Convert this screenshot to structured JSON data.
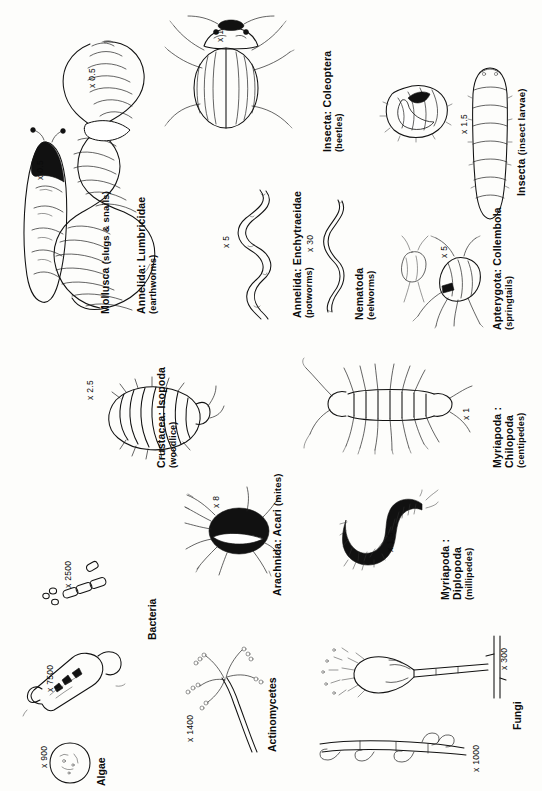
{
  "figure": {
    "orientation": "labels rotated 90 degrees counter-clockwise",
    "background_color": "#fdfdfb",
    "ink_color": "#111111"
  },
  "organisms": [
    {
      "id": "algae",
      "taxon": "Algae",
      "common": "",
      "magnification": "x 900",
      "icon": "algae-cell-icon"
    },
    {
      "id": "bacteria",
      "taxon": "Bacteria",
      "common": "",
      "magnification": "x 2500",
      "magnification_secondary": "x 7500",
      "icon": "bacteria-rods-icon"
    },
    {
      "id": "actinomycetes",
      "taxon": "Actinomycetes",
      "common": "",
      "magnification": "x 1400",
      "icon": "actinomycete-filament-icon"
    },
    {
      "id": "fungi",
      "taxon": "Fungi",
      "common": "",
      "magnification": "x 300",
      "magnification_secondary": "x 1000",
      "icon": "fungus-hypha-icon"
    },
    {
      "id": "acari",
      "taxon": "Arachnida: Acari",
      "common": "(mites)",
      "magnification": "x 8",
      "icon": "mite-icon"
    },
    {
      "id": "diplopoda",
      "taxon": "Myriapoda :",
      "taxon_line2": "Diplopoda",
      "common": "(millipedes)",
      "magnification": "x 1.5",
      "icon": "millipede-icon"
    },
    {
      "id": "isopoda",
      "taxon": "Crustacea: Isopoda",
      "common": "(woodlice)",
      "magnification": "x 2.5",
      "icon": "woodlouse-icon"
    },
    {
      "id": "chilopoda",
      "taxon": "Myriapoda :",
      "taxon_line2": "Chilopoda",
      "common": "(centipedes)",
      "magnification": "x 1",
      "icon": "centipede-icon"
    },
    {
      "id": "enchytraeidae",
      "taxon": "Annelida: Enchytraeidae",
      "common": "(potworms)",
      "magnification": "x 5",
      "icon": "potworm-icon"
    },
    {
      "id": "nematoda",
      "taxon": "Nematoda",
      "common": "(eelworms)",
      "magnification": "x 30",
      "icon": "eelworm-icon"
    },
    {
      "id": "collembola",
      "taxon": "Apterygota: Collembola",
      "common": "(springtails)",
      "magnification": "x 5",
      "icon": "springtail-icon"
    },
    {
      "id": "mollusca",
      "taxon": "Mollusca",
      "common": "(slugs & snails)",
      "magnification": "x 0.5",
      "icon": "slug-icon"
    },
    {
      "id": "lumbricidae",
      "taxon": "Annelida: Lumbricidae",
      "common": "(earthworms)",
      "magnification": "x 0.5",
      "icon": "earthworm-icon"
    },
    {
      "id": "coleoptera",
      "taxon": "Insecta: Coleoptera",
      "common": "(beetles)",
      "magnification": "x 1",
      "icon": "beetle-icon"
    },
    {
      "id": "insect_larvae",
      "taxon": "Insecta",
      "common": "(insect larvae)",
      "magnification": "x 1.5",
      "icon": "larva-icon"
    }
  ]
}
